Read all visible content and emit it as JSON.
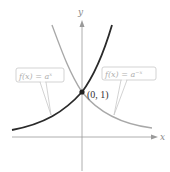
{
  "diagram": {
    "axes": {
      "x_label": "x",
      "y_label": "y"
    },
    "point": {
      "label": "(0, 1)"
    },
    "curves": [
      {
        "name": "increasing",
        "label": "f(x) = a^x",
        "label_base": "f(x) = a",
        "label_exp": "x",
        "color": "#2a2a2a"
      },
      {
        "name": "decreasing",
        "label": "f(x) = a^-x",
        "label_base": "f(x) = a",
        "label_exp": "−x",
        "color": "#a8a8a8"
      }
    ],
    "colors": {
      "axis": "#9a9a9a",
      "callout_border": "#c8c8c8",
      "callout_text": "#b0b0b0",
      "point": "#222222"
    }
  }
}
